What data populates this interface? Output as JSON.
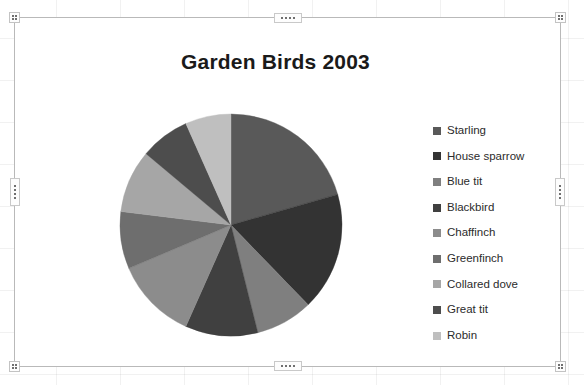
{
  "chart_object": {
    "title": "Garden Birds 2003",
    "selection_handles": [
      "top-left",
      "top-center",
      "top-right",
      "middle-left",
      "middle-right",
      "bottom-left",
      "bottom-center",
      "bottom-right"
    ]
  },
  "chart_data": {
    "type": "pie",
    "title": "Garden Birds 2003",
    "xlabel": "",
    "ylabel": "",
    "legend_position": "right",
    "grid": false,
    "start_angle_deg": 0,
    "direction": "clockwise",
    "categories": [
      "Starling",
      "House sparrow",
      "Blue tit",
      "Blackbird",
      "Chaffinch",
      "Greenfinch",
      "Collared dove",
      "Great tit",
      "Robin"
    ],
    "values": [
      74,
      62,
      30,
      38,
      43,
      30,
      33,
      26,
      24
    ],
    "percentages": [
      22.2,
      18.6,
      9.0,
      11.4,
      12.9,
      9.0,
      9.9,
      7.8,
      7.2
    ],
    "colors": [
      "#595959",
      "#333333",
      "#7f7f7f",
      "#404040",
      "#8c8c8c",
      "#6e6e6e",
      "#a6a6a6",
      "#4d4d4d",
      "#bfbfbf"
    ],
    "slices": [
      {
        "label": "Starling",
        "value": 74,
        "percent": 22.2,
        "color": "#595959",
        "start_deg": 0.0,
        "end_deg": 79.9
      },
      {
        "label": "House sparrow",
        "value": 62,
        "percent": 18.6,
        "color": "#333333",
        "start_deg": 79.9,
        "end_deg": 146.9
      },
      {
        "label": "Blue tit",
        "value": 30,
        "percent": 9.0,
        "color": "#7f7f7f",
        "start_deg": 146.9,
        "end_deg": 179.3
      },
      {
        "label": "Blackbird",
        "value": 38,
        "percent": 11.4,
        "color": "#404040",
        "start_deg": 179.3,
        "end_deg": 220.3
      },
      {
        "label": "Chaffinch",
        "value": 43,
        "percent": 12.9,
        "color": "#8c8c8c",
        "start_deg": 220.3,
        "end_deg": 266.7
      },
      {
        "label": "Greenfinch",
        "value": 30,
        "percent": 9.0,
        "color": "#6e6e6e",
        "start_deg": 266.7,
        "end_deg": 299.1
      },
      {
        "label": "Collared dove",
        "value": 33,
        "percent": 9.9,
        "color": "#a6a6a6",
        "start_deg": 299.1,
        "end_deg": 334.7
      },
      {
        "label": "Great tit",
        "value": 26,
        "percent": 7.8,
        "color": "#4d4d4d",
        "start_deg": 334.7,
        "end_deg": 362.8
      },
      {
        "label": "Robin",
        "value": 24,
        "percent": 7.2,
        "color": "#bfbfbf",
        "start_deg": 362.8,
        "end_deg": 388.7
      }
    ]
  },
  "legend": {
    "items": [
      {
        "label": "Starling",
        "color": "#595959"
      },
      {
        "label": "House sparrow",
        "color": "#333333"
      },
      {
        "label": "Blue tit",
        "color": "#7f7f7f"
      },
      {
        "label": "Blackbird",
        "color": "#404040"
      },
      {
        "label": "Chaffinch",
        "color": "#8c8c8c"
      },
      {
        "label": "Greenfinch",
        "color": "#6e6e6e"
      },
      {
        "label": "Collared dove",
        "color": "#a6a6a6"
      },
      {
        "label": "Great tit",
        "color": "#4d4d4d"
      },
      {
        "label": "Robin",
        "color": "#bfbfbf"
      }
    ]
  }
}
